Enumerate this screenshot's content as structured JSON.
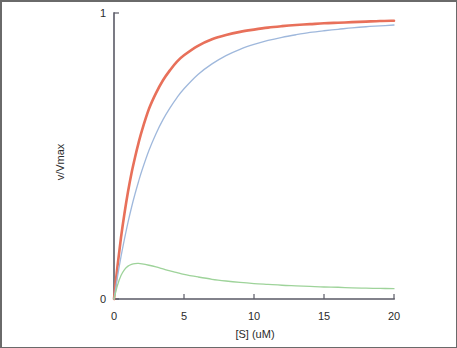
{
  "chart_data": {
    "type": "line",
    "title": "",
    "subtitle": "",
    "xlabel": "[S] (uM)",
    "ylabel": "v/Vmax",
    "xlim": [
      0,
      20
    ],
    "ylim": [
      0,
      1
    ],
    "xticks": [
      0,
      5,
      10,
      15,
      20
    ],
    "xtick_labels": [
      "0",
      "5",
      "10",
      "15",
      "20"
    ],
    "yticks": [
      0,
      1
    ],
    "ytick_labels": [
      "0",
      "1"
    ],
    "grid": false,
    "legend": "none",
    "series": [
      {
        "name": "red-curve",
        "color": "#e8705a",
        "width": 2.6,
        "x": [
          0,
          0.25,
          0.5,
          0.75,
          1,
          1.25,
          1.5,
          1.75,
          2,
          2.5,
          3,
          3.5,
          4,
          4.5,
          5,
          6,
          7,
          8,
          9,
          10,
          11,
          12,
          13,
          14,
          15,
          16,
          17,
          18,
          19,
          20
        ],
        "values": [
          0,
          0.115,
          0.215,
          0.3,
          0.375,
          0.44,
          0.495,
          0.545,
          0.59,
          0.665,
          0.72,
          0.765,
          0.8,
          0.83,
          0.852,
          0.885,
          0.908,
          0.923,
          0.934,
          0.942,
          0.949,
          0.954,
          0.958,
          0.961,
          0.964,
          0.966,
          0.968,
          0.97,
          0.972,
          0.973
        ]
      },
      {
        "name": "blue-curve",
        "color": "#9fb8dc",
        "width": 1.3,
        "x": [
          0,
          0.25,
          0.5,
          0.75,
          1,
          1.25,
          1.5,
          1.75,
          2,
          2.5,
          3,
          3.5,
          4,
          4.5,
          5,
          6,
          7,
          8,
          9,
          10,
          11,
          12,
          13,
          14,
          15,
          16,
          17,
          18,
          19,
          20
        ],
        "values": [
          0,
          0.078,
          0.148,
          0.21,
          0.268,
          0.32,
          0.367,
          0.41,
          0.45,
          0.52,
          0.578,
          0.627,
          0.668,
          0.704,
          0.735,
          0.785,
          0.822,
          0.851,
          0.873,
          0.89,
          0.904,
          0.915,
          0.924,
          0.932,
          0.938,
          0.943,
          0.948,
          0.952,
          0.955,
          0.958
        ]
      },
      {
        "name": "green-curve",
        "color": "#9ed39a",
        "width": 1.3,
        "x": [
          0,
          0.25,
          0.5,
          0.75,
          1,
          1.25,
          1.5,
          1.75,
          2,
          2.5,
          3,
          3.5,
          4,
          4.5,
          5,
          6,
          7,
          8,
          9,
          10,
          11,
          12,
          13,
          14,
          15,
          16,
          17,
          18,
          19,
          20
        ],
        "values": [
          0,
          0.048,
          0.082,
          0.103,
          0.115,
          0.121,
          0.124,
          0.1245,
          0.123,
          0.118,
          0.112,
          0.105,
          0.098,
          0.092,
          0.086,
          0.077,
          0.069,
          0.063,
          0.058,
          0.054,
          0.051,
          0.048,
          0.046,
          0.044,
          0.042,
          0.041,
          0.039,
          0.038,
          0.037,
          0.036
        ]
      }
    ]
  },
  "figure": {
    "background_color": "#ffffff",
    "border_color": "#6a6a6a",
    "axis_color": "#5a5a66",
    "text_color": "#2b2b2b"
  }
}
